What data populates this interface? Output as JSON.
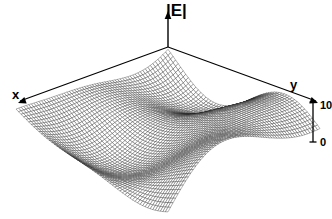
{
  "figure": {
    "background_color": "#ffffff",
    "ink_color": "#000000",
    "width": 332,
    "height": 219
  },
  "axes": {
    "vertical": {
      "label": "|E|",
      "icon": "arrow-up-icon"
    },
    "left": {
      "label": "x",
      "icon": "arrow-down-left-icon"
    },
    "right": {
      "label": "y",
      "icon": "arrow-down-right-icon"
    }
  },
  "scale_bar": {
    "top_label": "10",
    "bottom_label": "0",
    "icon": "vertical-scale-bar-icon"
  },
  "chart_data": {
    "type": "surface",
    "title": "",
    "subtitle": "",
    "xlabel": "x",
    "ylabel": "y",
    "zlabel": "|E|",
    "grid": false,
    "legend": "none",
    "annotations": [
      "|E|",
      "x",
      "y",
      "10",
      "0"
    ],
    "zlim": [
      0,
      10
    ],
    "z_ticks": [
      0,
      10
    ],
    "render": {
      "mesh_rows": 60,
      "mesh_cols": 60,
      "line_color": "#222222",
      "line_width": 0.35,
      "fill_color": "#ffffff",
      "projection": "isometric",
      "apex_x": 168,
      "apex_y": 47,
      "half_width": 152,
      "depth_y": 78,
      "z_scale": 46
    },
    "field_model": {
      "kind": "sum-of-random-plane-waves",
      "n_waves": 14,
      "mean": 5.0,
      "seed": 20240917,
      "components": [
        {
          "kx": 4.9,
          "ky": 1.6,
          "amp": 1.05,
          "phase": 0.42
        },
        {
          "kx": -2.4,
          "ky": 5.1,
          "amp": 0.95,
          "phase": 1.77
        },
        {
          "kx": 3.3,
          "ky": -4.4,
          "amp": 0.88,
          "phase": 2.61
        },
        {
          "kx": -5.6,
          "ky": -1.1,
          "amp": 0.8,
          "phase": 3.95
        },
        {
          "kx": 1.2,
          "ky": 6.2,
          "amp": 0.72,
          "phase": 0.93
        },
        {
          "kx": 6.4,
          "ky": -2.7,
          "amp": 0.68,
          "phase": 5.21
        },
        {
          "kx": -3.8,
          "ky": 3.9,
          "amp": 0.64,
          "phase": 4.08
        },
        {
          "kx": 7.1,
          "ky": 4.6,
          "amp": 0.55,
          "phase": 1.24
        },
        {
          "kx": -6.9,
          "ky": 2.2,
          "amp": 0.52,
          "phase": 2.88
        },
        {
          "kx": 2.0,
          "ky": -7.3,
          "amp": 0.48,
          "phase": 0.16
        },
        {
          "kx": 8.2,
          "ky": 0.7,
          "amp": 0.41,
          "phase": 3.37
        },
        {
          "kx": -1.5,
          "ky": -8.1,
          "amp": 0.38,
          "phase": 5.72
        },
        {
          "kx": 5.2,
          "ky": 7.6,
          "amp": 0.33,
          "phase": 2.05
        },
        {
          "kx": -7.7,
          "ky": -5.4,
          "amp": 0.3,
          "phase": 4.63
        }
      ]
    }
  }
}
